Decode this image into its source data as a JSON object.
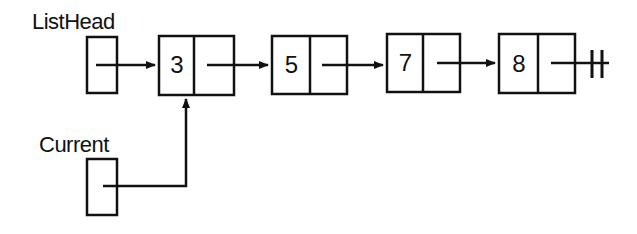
{
  "diagram": {
    "labels": {
      "list_head": "ListHead",
      "current": "Current"
    },
    "pointers": [
      {
        "name": "ListHead",
        "points_to_node_index": 0
      },
      {
        "name": "Current",
        "points_to_node_index": 0
      }
    ],
    "nodes": [
      {
        "value": "3",
        "next": 1
      },
      {
        "value": "5",
        "next": 2
      },
      {
        "value": "7",
        "next": 3
      },
      {
        "value": "8",
        "next": "null"
      }
    ],
    "null_symbol": "null-terminator",
    "colors": {
      "stroke": "#111111",
      "background": "#ffffff"
    }
  }
}
